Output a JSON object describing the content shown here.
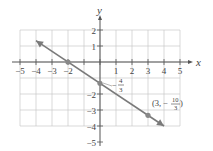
{
  "chart_data": {
    "type": "line",
    "title": "",
    "xlabel": "x",
    "ylabel": "y",
    "xlim": [
      -5,
      5
    ],
    "ylim": [
      -5,
      2
    ],
    "grid": true,
    "x_ticks": [
      -5,
      -4,
      -3,
      -2,
      -1,
      0,
      1,
      2,
      3,
      4,
      5
    ],
    "x_tick_labels": [
      "−5",
      "−4",
      "−3",
      "−2",
      "",
      "",
      "1",
      "2",
      "3",
      "4",
      "5"
    ],
    "y_ticks": [
      2,
      1,
      -2,
      -3,
      -4,
      -5
    ],
    "y_tick_labels": [
      "2",
      "1",
      "−2",
      "−3",
      "−4",
      "−5"
    ],
    "series": [
      {
        "name": "y = -2/3 x - 4/3",
        "x": [
          -4,
          4
        ],
        "y": [
          1.3333,
          -4
        ],
        "arrows": "both",
        "color": "#7a7a7a"
      }
    ],
    "points": [
      {
        "x": -2,
        "y": 0,
        "label": ""
      },
      {
        "x": 0,
        "y": -1.3333,
        "label": "−4/3"
      },
      {
        "x": 3,
        "y": -3.3333,
        "label": "(3, −10/3)"
      }
    ],
    "annotations": [
      {
        "text_num": "4",
        "text_den": "3",
        "sign": "−",
        "at": [
          0,
          -1.3333
        ]
      },
      {
        "text": "(3, −",
        "text_num": "10",
        "text_den": "3",
        "close": ")",
        "at": [
          3,
          -3.3333
        ]
      }
    ]
  },
  "labels": {
    "x_axis": "x",
    "y_axis": "y",
    "yint_sign": "−",
    "yint_num": "4",
    "yint_den": "3",
    "pt_open": "(3, −",
    "pt_num": "10",
    "pt_den": "3",
    "pt_close": ")"
  },
  "colors": {
    "grid": "#c8c8c8",
    "axis": "#555555",
    "line": "#7a7a7a",
    "point": "#888888"
  }
}
